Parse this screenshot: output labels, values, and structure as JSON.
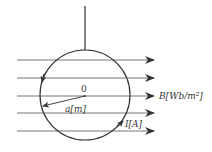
{
  "diagram": {
    "type": "physics-figure",
    "colors": {
      "stroke": "#333333",
      "field_lines": "#555555",
      "background": "#ffffff"
    },
    "labels": {
      "center": "0",
      "radius": "a[m]",
      "field": "B[Wb/m²]",
      "current": "I[A]"
    },
    "field_lines": {
      "count": 5,
      "direction": "right",
      "y_positions": [
        60,
        78,
        96,
        113,
        131
      ]
    },
    "loop": {
      "cx": 85,
      "cy": 95,
      "r": 45
    },
    "suspension_thread": {
      "x": 85,
      "y1": 6,
      "y2": 50
    }
  }
}
